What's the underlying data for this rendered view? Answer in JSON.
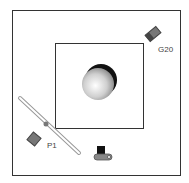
{
  "diagram": {
    "labels": {
      "g20": "G20",
      "p1": "P1"
    },
    "colors": {
      "frame": "#333333",
      "light": "#666666",
      "rail": "#bbbbbb"
    }
  }
}
